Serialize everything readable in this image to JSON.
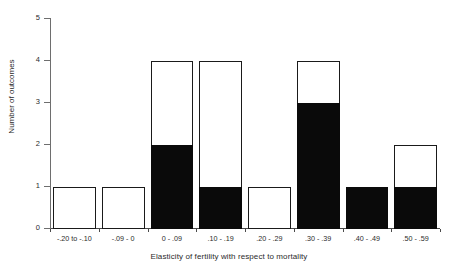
{
  "chart_data": {
    "type": "bar",
    "title": "",
    "subtitle": "",
    "xlabel": "Elasticity of fertility with respect to mortality",
    "ylabel": "Number of outcomes",
    "categories": [
      "-.20 to -.10",
      "-.09 - 0",
      "0 - .09",
      ".10 - .19",
      ".20 - .29",
      ".30 - .39",
      ".40 - .49",
      ".50 - .59"
    ],
    "values": [
      1,
      1,
      4,
      4,
      1,
      4,
      1,
      2
    ],
    "series": [
      {
        "name": "filled",
        "color": "#0a0a0a",
        "values": [
          0,
          0,
          2,
          1,
          0,
          3,
          1,
          1
        ]
      },
      {
        "name": "unfilled",
        "color": "#ffffff",
        "values": [
          1,
          1,
          2,
          3,
          1,
          1,
          0,
          1
        ]
      }
    ],
    "ylim": [
      0,
      5
    ],
    "yticks": [
      0,
      1,
      2,
      3,
      4,
      5
    ],
    "ytick_labels": [
      "0",
      "1",
      "2",
      "3",
      "4",
      "5"
    ],
    "grid": false,
    "legend": "none",
    "bar_edge_color": "#1a1a1a",
    "axis_color": "#4a4a4a",
    "background": "#ffffff"
  }
}
